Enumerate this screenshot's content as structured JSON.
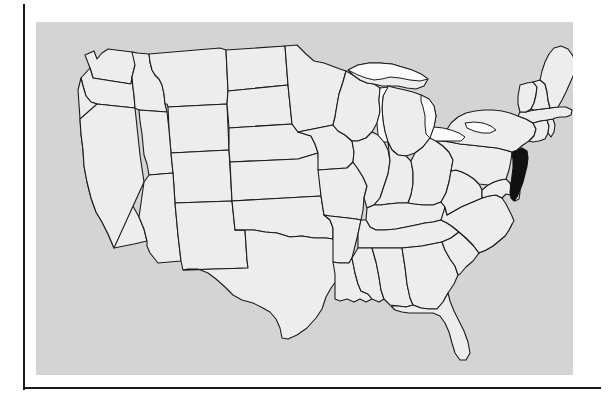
{
  "figure": {
    "kind": "us-states-locator-map",
    "plate_color": "#d4d4d4",
    "state_fill": "#ededed",
    "state_border": "#1b1b1b",
    "highlight_color": "#111111",
    "lake_fill": "#fbfbfb",
    "rule_color": "#1a1a1a"
  },
  "map": {
    "title": "",
    "caption": "",
    "highlighted_states": [
      "New Jersey"
    ],
    "water_features": [
      "Lake Superior",
      "Lake Michigan",
      "Lake Huron",
      "Lake Erie",
      "Lake Ontario"
    ],
    "states": [
      {
        "code": "WA",
        "name": "Washington",
        "highlighted": false
      },
      {
        "code": "OR",
        "name": "Oregon",
        "highlighted": false
      },
      {
        "code": "CA",
        "name": "California",
        "highlighted": false
      },
      {
        "code": "NV",
        "name": "Nevada",
        "highlighted": false
      },
      {
        "code": "ID",
        "name": "Idaho",
        "highlighted": false
      },
      {
        "code": "MT",
        "name": "Montana",
        "highlighted": false
      },
      {
        "code": "WY",
        "name": "Wyoming",
        "highlighted": false
      },
      {
        "code": "UT",
        "name": "Utah",
        "highlighted": false
      },
      {
        "code": "AZ",
        "name": "Arizona",
        "highlighted": false
      },
      {
        "code": "NM",
        "name": "New Mexico",
        "highlighted": false
      },
      {
        "code": "CO",
        "name": "Colorado",
        "highlighted": false
      },
      {
        "code": "ND",
        "name": "North Dakota",
        "highlighted": false
      },
      {
        "code": "SD",
        "name": "South Dakota",
        "highlighted": false
      },
      {
        "code": "NE",
        "name": "Nebraska",
        "highlighted": false
      },
      {
        "code": "KS",
        "name": "Kansas",
        "highlighted": false
      },
      {
        "code": "OK",
        "name": "Oklahoma",
        "highlighted": false
      },
      {
        "code": "TX",
        "name": "Texas",
        "highlighted": false
      },
      {
        "code": "MN",
        "name": "Minnesota",
        "highlighted": false
      },
      {
        "code": "IA",
        "name": "Iowa",
        "highlighted": false
      },
      {
        "code": "MO",
        "name": "Missouri",
        "highlighted": false
      },
      {
        "code": "AR",
        "name": "Arkansas",
        "highlighted": false
      },
      {
        "code": "LA",
        "name": "Louisiana",
        "highlighted": false
      },
      {
        "code": "WI",
        "name": "Wisconsin",
        "highlighted": false
      },
      {
        "code": "IL",
        "name": "Illinois",
        "highlighted": false
      },
      {
        "code": "MI",
        "name": "Michigan",
        "highlighted": false
      },
      {
        "code": "IN",
        "name": "Indiana",
        "highlighted": false
      },
      {
        "code": "OH",
        "name": "Ohio",
        "highlighted": false
      },
      {
        "code": "KY",
        "name": "Kentucky",
        "highlighted": false
      },
      {
        "code": "TN",
        "name": "Tennessee",
        "highlighted": false
      },
      {
        "code": "MS",
        "name": "Mississippi",
        "highlighted": false
      },
      {
        "code": "AL",
        "name": "Alabama",
        "highlighted": false
      },
      {
        "code": "GA",
        "name": "Georgia",
        "highlighted": false
      },
      {
        "code": "FL",
        "name": "Florida",
        "highlighted": false
      },
      {
        "code": "SC",
        "name": "South Carolina",
        "highlighted": false
      },
      {
        "code": "NC",
        "name": "North Carolina",
        "highlighted": false
      },
      {
        "code": "VA",
        "name": "Virginia",
        "highlighted": false
      },
      {
        "code": "WV",
        "name": "West Virginia",
        "highlighted": false
      },
      {
        "code": "MD",
        "name": "Maryland",
        "highlighted": false
      },
      {
        "code": "DE",
        "name": "Delaware",
        "highlighted": false
      },
      {
        "code": "PA",
        "name": "Pennsylvania",
        "highlighted": false
      },
      {
        "code": "NJ",
        "name": "New Jersey",
        "highlighted": true
      },
      {
        "code": "NY",
        "name": "New York",
        "highlighted": false
      },
      {
        "code": "CT",
        "name": "Connecticut",
        "highlighted": false
      },
      {
        "code": "RI",
        "name": "Rhode Island",
        "highlighted": false
      },
      {
        "code": "MA",
        "name": "Massachusetts",
        "highlighted": false
      },
      {
        "code": "VT",
        "name": "Vermont",
        "highlighted": false
      },
      {
        "code": "NH",
        "name": "New Hampshire",
        "highlighted": false
      },
      {
        "code": "ME",
        "name": "Maine",
        "highlighted": false
      }
    ]
  }
}
